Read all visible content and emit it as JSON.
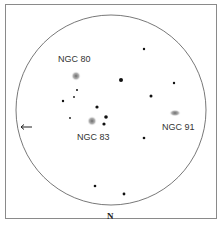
{
  "chart_title": "",
  "field_of_view": {
    "circle": {
      "cx": 111,
      "cy": 110,
      "r": 95
    },
    "orientation_label": "N",
    "direction_arrow": "←"
  },
  "objects": [
    {
      "name": "NGC 80",
      "x": 76,
      "y": 76,
      "label_x": 58,
      "label_y": 54,
      "type": "galaxy"
    },
    {
      "name": "NGC 83",
      "x": 92,
      "y": 121,
      "label_x": 77,
      "label_y": 132,
      "type": "galaxy"
    },
    {
      "name": "NGC 91",
      "x": 175,
      "y": 113,
      "label_x": 162,
      "label_y": 122,
      "type": "galaxy"
    }
  ],
  "stars": [
    {
      "x": 144,
      "y": 49,
      "size": 1.2
    },
    {
      "x": 121,
      "y": 80,
      "size": 2.0
    },
    {
      "x": 174,
      "y": 83,
      "size": 1.2
    },
    {
      "x": 151,
      "y": 96,
      "size": 1.5
    },
    {
      "x": 77,
      "y": 90,
      "size": 1.0
    },
    {
      "x": 74,
      "y": 97,
      "size": 0.9
    },
    {
      "x": 63,
      "y": 101,
      "size": 1.2
    },
    {
      "x": 97,
      "y": 107,
      "size": 1.6
    },
    {
      "x": 106,
      "y": 117,
      "size": 1.8
    },
    {
      "x": 70,
      "y": 118,
      "size": 0.9
    },
    {
      "x": 104,
      "y": 124,
      "size": 1.6
    },
    {
      "x": 144,
      "y": 138,
      "size": 1.3
    },
    {
      "x": 95,
      "y": 186,
      "size": 1.3
    },
    {
      "x": 124,
      "y": 194,
      "size": 1.4
    }
  ],
  "colors": {
    "frame": "#8a8a8a",
    "circle": "#555555",
    "star": "#111111",
    "galaxy": "#777777",
    "label": "#333333"
  }
}
